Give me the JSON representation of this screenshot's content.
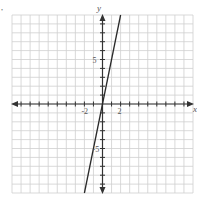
{
  "chart_data": {
    "type": "line",
    "title": "",
    "xlabel": "x",
    "ylabel": "y",
    "xlim": [
      -10,
      10
    ],
    "ylim": [
      -10,
      10
    ],
    "grid": true,
    "grid_step": 1,
    "x_tick_labels": [
      {
        "value": -2,
        "label": "-2"
      },
      {
        "value": 2,
        "label": "2"
      }
    ],
    "y_tick_labels": [
      {
        "value": 5,
        "label": "5"
      },
      {
        "value": -5,
        "label": "-5"
      }
    ],
    "series": [
      {
        "name": "y = 5x",
        "equation": "y = 5x",
        "x": [
          -2,
          2
        ],
        "y": [
          -10,
          10
        ]
      }
    ],
    "corner_mark": ","
  },
  "colors": {
    "grid": "#cfcfcf",
    "axis": "#333333",
    "line": "#2a2a2a",
    "label": "#555555"
  }
}
